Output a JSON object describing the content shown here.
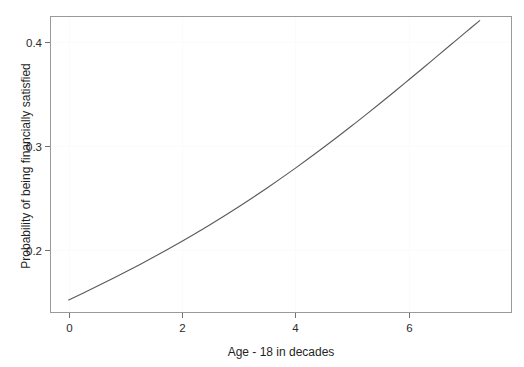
{
  "chart_data": {
    "type": "line",
    "title": "",
    "subtitle": "",
    "xlabel": "Age - 18 in decades",
    "ylabel": "Probability of being financially satisfied",
    "xlim": [
      -0.33,
      7.82
    ],
    "ylim": [
      0.1395,
      0.4245
    ],
    "xticks": [
      0,
      2,
      4,
      6
    ],
    "xtick_labels": [
      "0",
      "2",
      "4",
      "6"
    ],
    "yticks": [
      0.2,
      0.3,
      0.4
    ],
    "ytick_labels": [
      "0.2",
      "0.3",
      "0.4"
    ],
    "grid": true,
    "legend": null,
    "annotations": [],
    "series": [
      {
        "name": "fitted probability",
        "x": [
          0.0,
          0.25,
          0.5,
          0.75,
          1.0,
          1.25,
          1.5,
          1.75,
          2.0,
          2.25,
          2.5,
          2.75,
          3.0,
          3.25,
          3.5,
          3.75,
          4.0,
          4.25,
          4.5,
          4.75,
          5.0,
          5.25,
          5.5,
          5.75,
          6.0,
          6.25,
          6.5,
          6.75,
          7.0,
          7.25
        ],
        "y": [
          0.152,
          0.1585,
          0.1651,
          0.1719,
          0.1788,
          0.1859,
          0.1932,
          0.2007,
          0.2084,
          0.2163,
          0.2245,
          0.2329,
          0.2415,
          0.2504,
          0.2595,
          0.2689,
          0.2785,
          0.2884,
          0.2985,
          0.3088,
          0.3194,
          0.3301,
          0.341,
          0.3521,
          0.3633,
          0.3746,
          0.386,
          0.3974,
          0.4088,
          0.4201
        ]
      }
    ]
  },
  "axes": {
    "x_axis_title": "Age - 18 in decades",
    "y_axis_title": "Probability of being financially satisfied"
  },
  "colors": {
    "curve": "#5b5b5b",
    "frame": "#9a9a9a",
    "grid": "#fbfbfb",
    "background": "#ffffff",
    "text": "#2b2b2b"
  }
}
